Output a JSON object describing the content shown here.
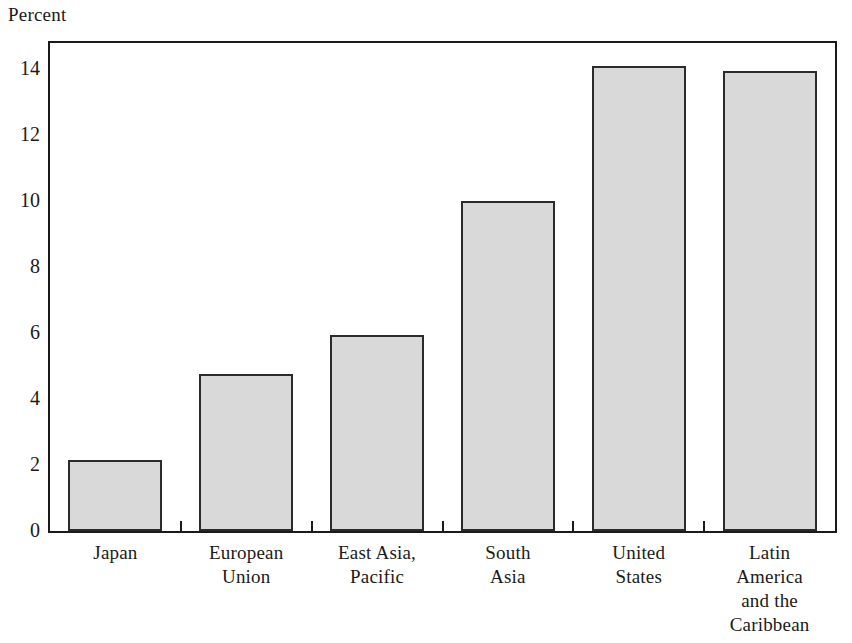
{
  "chart_data": {
    "type": "bar",
    "title": "",
    "subtitle": "",
    "xlabel": "",
    "ylabel": "Percent",
    "ylim": [
      0,
      14.8
    ],
    "yticks": [
      0,
      2,
      4,
      6,
      8,
      10,
      12,
      14
    ],
    "ytick_labels": [
      "0",
      "2",
      "4",
      "6",
      "8",
      "10",
      "12",
      "14"
    ],
    "grid": false,
    "legend": false,
    "legend_position": "none",
    "categories": [
      "Japan",
      "European Union",
      "East Asia, Pacific",
      "South Asia",
      "United States",
      "Latin America and the Caribbean"
    ],
    "category_lines": [
      [
        "Japan"
      ],
      [
        "European",
        "Union"
      ],
      [
        "East Asia,",
        "Pacific"
      ],
      [
        "South",
        "Asia"
      ],
      [
        "United",
        "States"
      ],
      [
        "Latin",
        "America",
        "and the",
        "Caribbean"
      ]
    ],
    "values": [
      2.15,
      4.75,
      5.95,
      10.0,
      14.1,
      13.95
    ],
    "bar_fill": "#d9d9d9",
    "bar_edge": "#2b2b2b",
    "axis_color": "#1a1a1a",
    "background": "#ffffff"
  }
}
